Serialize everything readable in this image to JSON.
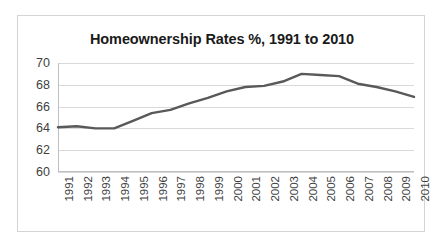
{
  "chart_data": {
    "type": "line",
    "title": "Homeownership Rates %, 1991 to 2010",
    "xlabel": "",
    "ylabel": "",
    "ylim": [
      60,
      70
    ],
    "yticks": [
      60,
      62,
      64,
      66,
      68,
      70
    ],
    "grid": true,
    "legend": "none",
    "line_color": "#595959",
    "categories": [
      "1991",
      "1992",
      "1993",
      "1994",
      "1995",
      "1996",
      "1997",
      "1998",
      "1999",
      "2000",
      "2001",
      "2002",
      "2003",
      "2004",
      "2005",
      "2006",
      "2007",
      "2008",
      "2009",
      "2010"
    ],
    "values": [
      64.1,
      64.2,
      64.0,
      64.0,
      64.7,
      65.4,
      65.7,
      66.3,
      66.8,
      67.4,
      67.8,
      67.9,
      68.3,
      69.0,
      68.9,
      68.8,
      68.1,
      67.8,
      67.4,
      66.9
    ],
    "series": [
      {
        "name": "Homeownership Rate",
        "values": [
          64.1,
          64.2,
          64.0,
          64.0,
          64.7,
          65.4,
          65.7,
          66.3,
          66.8,
          67.4,
          67.8,
          67.9,
          68.3,
          69.0,
          68.9,
          68.8,
          68.1,
          67.8,
          67.4,
          66.9
        ]
      }
    ]
  }
}
